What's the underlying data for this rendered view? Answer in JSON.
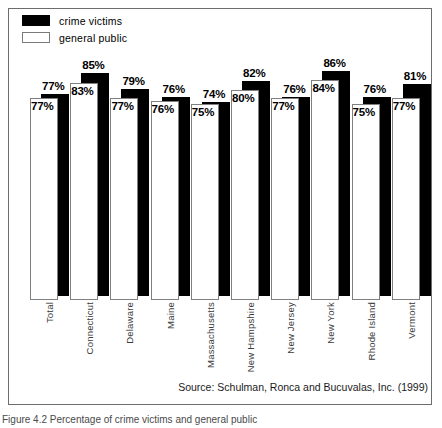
{
  "legend": {
    "items": [
      {
        "label": "crime victims",
        "style": "filled",
        "color": "#000000",
        "name": "crime-victims"
      },
      {
        "label": "general public",
        "style": "hollow",
        "color": "#ffffff",
        "name": "general-public"
      }
    ]
  },
  "source": "Source: Schulman, Ronca and Bucuvalas, Inc. (1999)",
  "caption": "Figure 4.2   Percentage of crime victims and general public",
  "chart_data": {
    "type": "bar",
    "title": "",
    "subtitle": "",
    "xlabel": "",
    "ylabel": "",
    "ylim": [
      0,
      100
    ],
    "grid": false,
    "legend_position": "top-left",
    "value_suffix": "%",
    "categories": [
      "Total",
      "Connecticut",
      "Delaware",
      "Maine",
      "Massachusetts",
      "New Hampshire",
      "New Jersey",
      "New York",
      "Rhode Island",
      "Vermont"
    ],
    "series": [
      {
        "name": "crime victims",
        "color": "#000000",
        "values": [
          77,
          85,
          79,
          76,
          74,
          82,
          76,
          86,
          76,
          81
        ],
        "labels": [
          "77%",
          "85%",
          "79%",
          "76%",
          "74%",
          "82%",
          "76%",
          "86%",
          "76%",
          "81%"
        ]
      },
      {
        "name": "general public",
        "color": "#ffffff",
        "values": [
          77,
          83,
          77,
          76,
          75,
          80,
          77,
          84,
          75,
          77
        ],
        "labels": [
          "77%",
          "83%",
          "77%",
          "76%",
          "75%",
          "80%",
          "77%",
          "84%",
          "75%",
          "77%"
        ]
      }
    ]
  }
}
